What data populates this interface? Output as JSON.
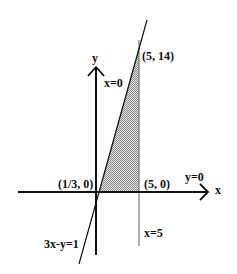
{
  "diagram": {
    "axes": {
      "x_label": "x",
      "y_label": "y"
    },
    "points": {
      "top": "(5, 14)",
      "origin_left": "(1/3, 0)",
      "origin_right": "(5, 0)"
    },
    "lines": {
      "y_axis_eq": "x=0",
      "x_axis_eq": "y=0",
      "vertical_eq": "x=5",
      "slant_eq": "3x-y=1"
    },
    "colors": {
      "stroke": "#111111",
      "shade": "#bbbbbb",
      "vertical": "#777777"
    }
  }
}
